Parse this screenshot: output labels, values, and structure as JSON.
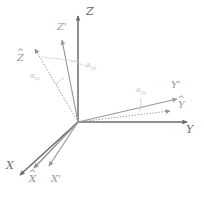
{
  "figure": {
    "type": "diagram",
    "title": "",
    "background_color": "#ffffff",
    "origin": {
      "x": 78,
      "y": 122
    }
  },
  "colors": {
    "primary_axis": "#6b6b6b",
    "secondary_axis": "#8f8f8f",
    "hat_axis": "#9a9a9a",
    "faint": "#bdbdbd",
    "label": "#707070",
    "angle_label": "#c2c2c2"
  },
  "axes": [
    {
      "id": "Z",
      "label": "Z",
      "kind": "primary",
      "color": "#6b6b6b",
      "style": "solid",
      "start": {
        "x": 78,
        "y": 122
      },
      "end": {
        "x": 78,
        "y": 14
      },
      "label_pos": {
        "x": 86,
        "y": 8
      }
    },
    {
      "id": "Y",
      "label": "Y",
      "kind": "primary",
      "color": "#6b6b6b",
      "style": "solid",
      "start": {
        "x": 78,
        "y": 122
      },
      "end": {
        "x": 189,
        "y": 122
      },
      "label_pos": {
        "x": 186,
        "y": 126
      }
    },
    {
      "id": "X",
      "label": "X",
      "kind": "primary",
      "color": "#6b6b6b",
      "style": "solid",
      "start": {
        "x": 78,
        "y": 122
      },
      "end": {
        "x": 18,
        "y": 177
      },
      "label_pos": {
        "x": 7,
        "y": 165
      }
    },
    {
      "id": "Zp",
      "label": "Z'",
      "kind": "primed",
      "color": "#9a9a9a",
      "style": "solid",
      "start": {
        "x": 78,
        "y": 122
      },
      "end": {
        "x": 61,
        "y": 38
      },
      "label_pos": {
        "x": 58,
        "y": 24
      }
    },
    {
      "id": "Yp",
      "label": "Y'",
      "kind": "primed",
      "color": "#9a9a9a",
      "style": "solid",
      "start": {
        "x": 78,
        "y": 122
      },
      "end": {
        "x": 179,
        "y": 98
      },
      "label_pos": {
        "x": 172,
        "y": 84
      }
    },
    {
      "id": "Xp",
      "label": "X'",
      "kind": "primed",
      "color": "#9a9a9a",
      "style": "solid",
      "start": {
        "x": 78,
        "y": 122
      },
      "end": {
        "x": 47,
        "y": 168
      },
      "label_pos": {
        "x": 50,
        "y": 176
      }
    },
    {
      "id": "Zhat",
      "label": "Z",
      "accent": "hat",
      "kind": "hat",
      "color": "#9a9a9a",
      "style": "dotted",
      "start": {
        "x": 78,
        "y": 122
      },
      "end": {
        "x": 33,
        "y": 47
      },
      "label_pos": {
        "x": 18,
        "y": 56
      }
    },
    {
      "id": "Yhat",
      "label": "Y",
      "accent": "hat",
      "kind": "hat",
      "color": "#9a9a9a",
      "style": "dotted",
      "start": {
        "x": 78,
        "y": 122
      },
      "end": {
        "x": 172,
        "y": 110
      },
      "label_pos": {
        "x": 178,
        "y": 103
      }
    },
    {
      "id": "Xhat",
      "label": "X",
      "accent": "hat",
      "kind": "hat",
      "color": "#8f8f8f",
      "style": "solid",
      "start": {
        "x": 78,
        "y": 122
      },
      "end": {
        "x": 32,
        "y": 170
      },
      "label_pos": {
        "x": 30,
        "y": 176
      }
    }
  ],
  "angles": [
    {
      "id": "alpha_zz",
      "symbol": "α",
      "subscript": "zz",
      "label_pos": {
        "x": 32,
        "y": 76
      },
      "between": [
        "Zhat",
        "Zp"
      ]
    },
    {
      "id": "alpha_yy",
      "symbol": "α",
      "subscript": "yy",
      "label_pos": {
        "x": 86,
        "y": 64
      },
      "between": [
        "Zp",
        "Z"
      ]
    },
    {
      "id": "alpha_yz",
      "symbol": "α",
      "subscript": "yz",
      "label_pos": {
        "x": 137,
        "y": 90
      },
      "between": [
        "Yp",
        "Yhat"
      ]
    }
  ]
}
